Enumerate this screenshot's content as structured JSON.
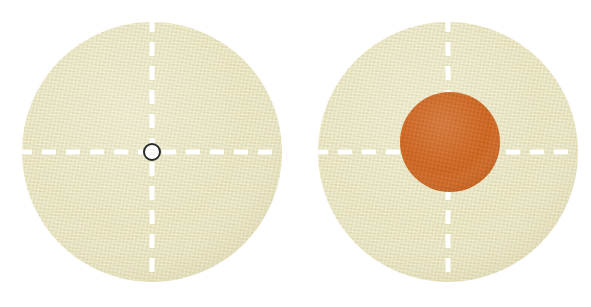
{
  "figure": {
    "background_color": "#ffffff",
    "width": 591,
    "height": 307,
    "panel_labels": [
      "",
      ""
    ]
  },
  "colors": {
    "fabric_beige": "#e6e2bd",
    "fabric_beige_shade": "#ddd8b0",
    "fabric_weave_light": "#eeeacb",
    "fabric_weave_dark": "#d9d4a9",
    "guide_white": "#ffffff",
    "orange_disc": "#cc6622",
    "orange_disc_shade": "#c05f1e",
    "hub_fill": "#ffffff",
    "hub_stroke": "#2b2b2b"
  },
  "panels": [
    {
      "name": "left-disc",
      "label": "",
      "disc": {
        "center_x": 152,
        "center_y": 152,
        "radius": 130,
        "fill": "#e6e2bd"
      },
      "guides": {
        "style": "dashed",
        "color": "#ffffff",
        "stroke_width": 5,
        "dash_pattern": "14 10",
        "vertical": true,
        "horizontal": true
      },
      "center_hub": {
        "visible": true,
        "center_x": 152,
        "center_y": 152,
        "radius": 8,
        "fill": "#ffffff",
        "stroke": "#2b2b2b",
        "stroke_width": 2
      },
      "overlay_disc": {
        "visible": false
      }
    },
    {
      "name": "right-disc",
      "label": "",
      "disc": {
        "center_x": 448,
        "center_y": 152,
        "radius": 130,
        "fill": "#e6e2bd"
      },
      "guides": {
        "style": "dashed",
        "color": "#ffffff",
        "stroke_width": 5,
        "dash_pattern": "14 10",
        "vertical": true,
        "horizontal": true
      },
      "center_hub": {
        "visible": false
      },
      "overlay_disc": {
        "visible": true,
        "center_x": 450,
        "center_y": 142,
        "radius": 50,
        "fill": "#cc6622"
      }
    }
  ]
}
